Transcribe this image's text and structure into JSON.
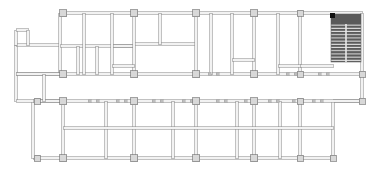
{
  "document": {
    "type": "architectural-floor-plan",
    "title": "Floor Plan",
    "canvas": {
      "width": 376,
      "height": 174
    },
    "background_color": "#ffffff",
    "line_color": "#8e8e8e",
    "line_color_dark": "#6e6e6e",
    "wall_fill": "#f2f2f2",
    "column_fill": "#d8d8d8",
    "column_stroke": "#7a7a7a",
    "hatch_fill": "#5a5a5a",
    "hatch_line": "#ffffff",
    "solid_block_fill": "#111111"
  },
  "plan": {
    "extents": {
      "left": 13,
      "top": 13,
      "right": 362,
      "bottom": 158
    },
    "wall_thickness": 2.6,
    "grid": {
      "vertical_axis_x": [
        63,
        134,
        196,
        254,
        300,
        362
      ],
      "horizontal_axis_y": [
        13,
        74,
        101,
        158
      ],
      "lower_vertical_x": [
        37,
        63,
        106,
        134,
        173,
        196,
        237,
        254,
        280,
        300,
        333,
        362
      ],
      "description": "Structural column grid: upper zone partitioned block, lower zone regular bays"
    },
    "columns": [
      {
        "x": 63,
        "y": 13,
        "w": 7,
        "h": 7
      },
      {
        "x": 134,
        "y": 13,
        "w": 7,
        "h": 7
      },
      {
        "x": 196,
        "y": 13,
        "w": 7,
        "h": 7
      },
      {
        "x": 254,
        "y": 13,
        "w": 7,
        "h": 7
      },
      {
        "x": 300,
        "y": 13,
        "w": 6,
        "h": 6
      },
      {
        "x": 63,
        "y": 74,
        "w": 7,
        "h": 7
      },
      {
        "x": 134,
        "y": 74,
        "w": 7,
        "h": 7
      },
      {
        "x": 196,
        "y": 74,
        "w": 7,
        "h": 7
      },
      {
        "x": 254,
        "y": 74,
        "w": 7,
        "h": 7
      },
      {
        "x": 300,
        "y": 74,
        "w": 6,
        "h": 6
      },
      {
        "x": 362,
        "y": 74,
        "w": 6,
        "h": 6
      },
      {
        "x": 37,
        "y": 101,
        "w": 6,
        "h": 6
      },
      {
        "x": 63,
        "y": 101,
        "w": 7,
        "h": 7
      },
      {
        "x": 134,
        "y": 101,
        "w": 7,
        "h": 7
      },
      {
        "x": 196,
        "y": 101,
        "w": 7,
        "h": 7
      },
      {
        "x": 254,
        "y": 101,
        "w": 7,
        "h": 7
      },
      {
        "x": 300,
        "y": 101,
        "w": 6,
        "h": 6
      },
      {
        "x": 362,
        "y": 101,
        "w": 6,
        "h": 6
      },
      {
        "x": 37,
        "y": 158,
        "w": 6,
        "h": 6
      },
      {
        "x": 63,
        "y": 158,
        "w": 7,
        "h": 7
      },
      {
        "x": 134,
        "y": 158,
        "w": 7,
        "h": 7
      },
      {
        "x": 196,
        "y": 158,
        "w": 7,
        "h": 7
      },
      {
        "x": 254,
        "y": 158,
        "w": 7,
        "h": 7
      },
      {
        "x": 300,
        "y": 158,
        "w": 6,
        "h": 6
      },
      {
        "x": 333,
        "y": 158,
        "w": 6,
        "h": 6
      }
    ],
    "outer_walls": [
      {
        "name": "top-wall-main",
        "x1": 60,
        "y1": 13,
        "x2": 362,
        "y2": 13
      },
      {
        "name": "right-wall",
        "x1": 362,
        "y1": 13,
        "x2": 362,
        "y2": 101
      },
      {
        "name": "bottom-wall-right",
        "x1": 333,
        "y1": 101,
        "x2": 362,
        "y2": 101
      },
      {
        "name": "bottom-wall-main",
        "x1": 33,
        "y1": 158,
        "x2": 333,
        "y2": 158
      },
      {
        "name": "right-lower-wall",
        "x1": 333,
        "y1": 101,
        "x2": 333,
        "y2": 158
      },
      {
        "name": "left-wall-lower",
        "x1": 33,
        "y1": 101,
        "x2": 33,
        "y2": 158
      },
      {
        "name": "left-wall-upper",
        "x1": 16,
        "y1": 45,
        "x2": 16,
        "y2": 101
      },
      {
        "name": "left-band-top",
        "x1": 16,
        "y1": 45,
        "x2": 60,
        "y2": 45
      },
      {
        "name": "left-band-bottom",
        "x1": 16,
        "y1": 101,
        "x2": 60,
        "y2": 101
      },
      {
        "name": "left-notch-left",
        "x1": 16,
        "y1": 30,
        "x2": 16,
        "y2": 45
      },
      {
        "name": "left-notch-top",
        "x1": 16,
        "y1": 30,
        "x2": 28,
        "y2": 30
      },
      {
        "name": "left-notch-right",
        "x1": 28,
        "y1": 30,
        "x2": 28,
        "y2": 45
      },
      {
        "name": "upper-left-vert",
        "x1": 60,
        "y1": 13,
        "x2": 60,
        "y2": 74
      }
    ],
    "interior_walls": [
      {
        "name": "mid-band-top",
        "x1": 16,
        "y1": 74,
        "x2": 362,
        "y2": 74
      },
      {
        "name": "mid-band-bottom",
        "x1": 33,
        "y1": 101,
        "x2": 362,
        "y2": 101
      },
      {
        "name": "upper-partition-h1",
        "x1": 60,
        "y1": 46,
        "x2": 134,
        "y2": 46
      },
      {
        "name": "upper-partition-h2",
        "x1": 112,
        "y1": 46,
        "x2": 134,
        "y2": 46
      },
      {
        "name": "upper-vert-a",
        "x1": 84,
        "y1": 13,
        "x2": 84,
        "y2": 74
      },
      {
        "name": "upper-vert-b",
        "x1": 112,
        "y1": 13,
        "x2": 112,
        "y2": 74
      },
      {
        "name": "upper-vert-c",
        "x1": 78,
        "y1": 46,
        "x2": 78,
        "y2": 74
      },
      {
        "name": "upper-vert-d",
        "x1": 97,
        "y1": 46,
        "x2": 97,
        "y2": 74
      },
      {
        "name": "block-h-mid",
        "x1": 134,
        "y1": 44,
        "x2": 196,
        "y2": 44
      },
      {
        "name": "block-vert-e",
        "x1": 160,
        "y1": 13,
        "x2": 160,
        "y2": 44
      },
      {
        "name": "block-vert-f",
        "x1": 196,
        "y1": 13,
        "x2": 196,
        "y2": 74
      },
      {
        "name": "block-vert-g",
        "x1": 211,
        "y1": 13,
        "x2": 211,
        "y2": 74
      },
      {
        "name": "block-vert-h",
        "x1": 232,
        "y1": 13,
        "x2": 232,
        "y2": 74
      },
      {
        "name": "block-vert-i",
        "x1": 254,
        "y1": 13,
        "x2": 254,
        "y2": 74
      },
      {
        "name": "block-vert-j",
        "x1": 278,
        "y1": 13,
        "x2": 278,
        "y2": 74
      },
      {
        "name": "block-vert-k",
        "x1": 300,
        "y1": 13,
        "x2": 300,
        "y2": 74
      },
      {
        "name": "block-vert-l",
        "x1": 134,
        "y1": 13,
        "x2": 134,
        "y2": 74
      },
      {
        "name": "stub-wall-1",
        "x1": 232,
        "y1": 60,
        "x2": 254,
        "y2": 60
      },
      {
        "name": "stub-wall-2",
        "x1": 278,
        "y1": 66,
        "x2": 300,
        "y2": 66
      },
      {
        "name": "stub-wall-3",
        "x1": 112,
        "y1": 66,
        "x2": 134,
        "y2": 66
      },
      {
        "name": "stub-wall-4",
        "x1": 300,
        "y1": 66,
        "x2": 333,
        "y2": 66
      },
      {
        "name": "lower-vert-1",
        "x1": 63,
        "y1": 101,
        "x2": 63,
        "y2": 158
      },
      {
        "name": "lower-vert-2",
        "x1": 106,
        "y1": 101,
        "x2": 106,
        "y2": 158
      },
      {
        "name": "lower-vert-3",
        "x1": 134,
        "y1": 101,
        "x2": 134,
        "y2": 158
      },
      {
        "name": "lower-vert-4",
        "x1": 173,
        "y1": 101,
        "x2": 173,
        "y2": 158
      },
      {
        "name": "lower-vert-5",
        "x1": 196,
        "y1": 101,
        "x2": 196,
        "y2": 158
      },
      {
        "name": "lower-vert-6",
        "x1": 237,
        "y1": 101,
        "x2": 237,
        "y2": 158
      },
      {
        "name": "lower-vert-7",
        "x1": 254,
        "y1": 101,
        "x2": 254,
        "y2": 158
      },
      {
        "name": "lower-vert-8",
        "x1": 280,
        "y1": 101,
        "x2": 280,
        "y2": 158
      },
      {
        "name": "lower-vert-9",
        "x1": 300,
        "y1": 101,
        "x2": 300,
        "y2": 158
      },
      {
        "name": "lower-horiz-1",
        "x1": 63,
        "y1": 128,
        "x2": 333,
        "y2": 128
      },
      {
        "name": "upper-left-h",
        "x1": 16,
        "y1": 74,
        "x2": 60,
        "y2": 74
      },
      {
        "name": "left-low-vert",
        "x1": 44,
        "y1": 74,
        "x2": 44,
        "y2": 101
      }
    ],
    "stair_block": {
      "name": "stair-shaft",
      "x": 331,
      "y": 14,
      "width": 30,
      "height": 48,
      "solid_head": {
        "x": 331,
        "y": 14,
        "width": 30,
        "height": 10
      },
      "tread_rows": 14,
      "flights": 2,
      "label": "stair"
    },
    "corner_marker": {
      "name": "corner-dot",
      "x": 330,
      "y": 13,
      "size": 5
    },
    "tick_marks_row_y": 101,
    "tick_marks_x": [
      88,
      96,
      116,
      124,
      152,
      160,
      182,
      190,
      216,
      224,
      244,
      252,
      268,
      276,
      292,
      300,
      312,
      320
    ],
    "tick_marks_row2_y": 74,
    "tick_marks2_x": [
      208,
      216,
      286,
      294,
      318,
      326
    ]
  },
  "accessibility": {
    "description": "Monochrome CAD-style architectural floor plan: rectangular building footprint with a structural column grid, subdivided upper-left rooms, a long central corridor band, regular lower bays, and a hatched stair shaft at the upper right."
  }
}
